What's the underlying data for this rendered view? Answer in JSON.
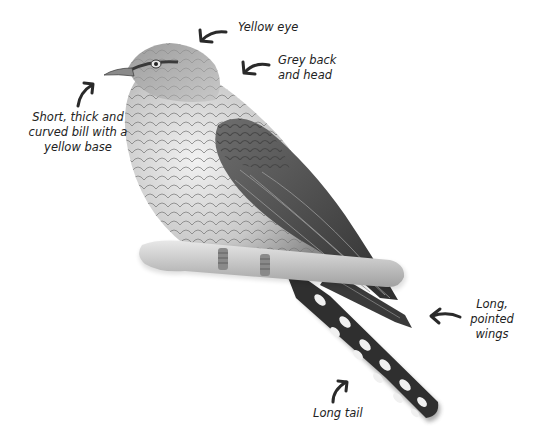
{
  "diagram": {
    "colors": {
      "background": "#ffffff",
      "text": "#222222",
      "arrow": "#2a2a2a",
      "plumage_light": "#e4e4e4",
      "plumage_mid": "#9a9a9a",
      "plumage_dark": "#3a3a3a",
      "perch": "#cfcfcf"
    },
    "labels": {
      "yellow_eye": {
        "lines": [
          "Yellow eye"
        ]
      },
      "grey_back": {
        "lines": [
          "Grey back",
          "and head"
        ]
      },
      "bill": {
        "lines": [
          "Short, thick and",
          "curved bill with a",
          "yellow base"
        ]
      },
      "wings": {
        "lines": [
          "Long,",
          "pointed",
          "wings"
        ]
      },
      "tail": {
        "lines": [
          "Long tail"
        ]
      }
    }
  }
}
